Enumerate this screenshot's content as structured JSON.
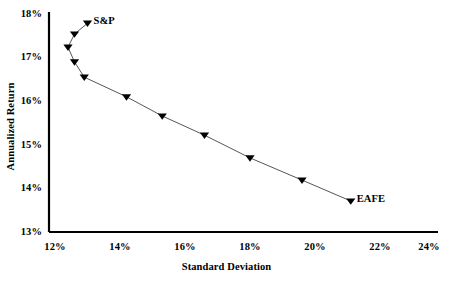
{
  "chart_data": {
    "type": "line",
    "title": "",
    "subtitle": "",
    "xlabel": "Standard Deviation",
    "ylabel": "Annualized Return",
    "xlim": [
      12,
      24
    ],
    "ylim": [
      13,
      18
    ],
    "xticks": [
      "12%",
      "14%",
      "16%",
      "18%",
      "20%",
      "22%",
      "24%"
    ],
    "yticks": [
      "18%",
      "17%",
      "16%",
      "15%",
      "14%",
      "13%"
    ],
    "xtick_values": [
      12,
      14,
      16,
      18,
      20,
      22,
      24
    ],
    "ytick_values": [
      18,
      17,
      16,
      15,
      14,
      13
    ],
    "grid": false,
    "legend": false,
    "legend_position": "none",
    "marker": "triangle-down",
    "marker_color": "#000000",
    "line_color": "#555555",
    "series": [
      {
        "name": "Efficient frontier",
        "x": [
          13.0,
          12.6,
          12.4,
          12.6,
          12.9,
          14.2,
          15.3,
          16.6,
          18.0,
          19.6,
          21.1
        ],
        "y": [
          17.79,
          17.54,
          17.24,
          16.9,
          16.55,
          16.1,
          15.66,
          15.22,
          14.7,
          14.19,
          13.71
        ]
      }
    ],
    "annotations": [
      {
        "text": "S&P",
        "x": 13.0,
        "y": 17.79
      },
      {
        "text": "EAFE",
        "x": 21.1,
        "y": 13.71
      }
    ]
  },
  "axes": {
    "y_title": "Annualized Return",
    "x_title": "Standard Deviation",
    "y_ticks": [
      {
        "label": "18%"
      },
      {
        "label": "17%"
      },
      {
        "label": "16%"
      },
      {
        "label": "15%"
      },
      {
        "label": "14%"
      },
      {
        "label": "13%"
      }
    ],
    "x_ticks": [
      {
        "label": "12%"
      },
      {
        "label": "14%"
      },
      {
        "label": "16%"
      },
      {
        "label": "18%"
      },
      {
        "label": "20%"
      },
      {
        "label": "22%"
      },
      {
        "label": "24%"
      }
    ]
  },
  "annotations": {
    "sp": "S&P",
    "eafe": "EAFE"
  }
}
